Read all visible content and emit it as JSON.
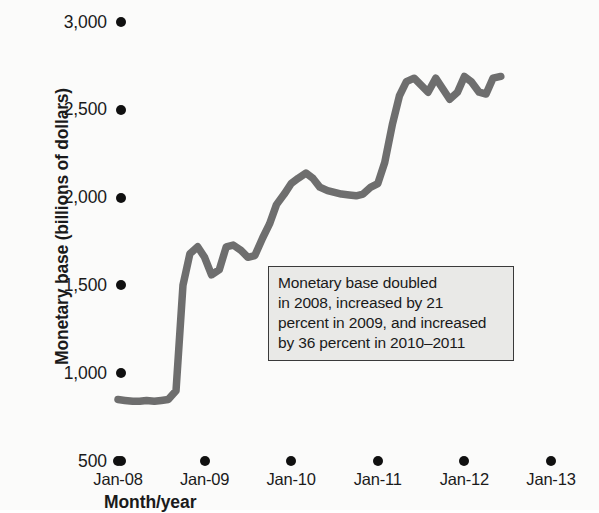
{
  "figure": {
    "background_color": "#fbfbfa",
    "line_color": "#6e6e6e",
    "tick_color": "#101010",
    "annotation_fill": "#e9e9e7",
    "annotation_border": "#3a3a3a"
  },
  "annotation": {
    "name": "monetary-base-callout",
    "lines": [
      "Monetary base doubled",
      "in 2008, increased by 21",
      "percent in 2009, and increased",
      "by 36 percent in 2010–2011"
    ]
  },
  "chart_data": {
    "type": "line",
    "title": "",
    "xlabel": "Month/year",
    "ylabel": "Monetary base (billions of dollars)",
    "ylim": [
      500,
      3000
    ],
    "ytick_values": [
      3000,
      2500,
      2000,
      1500,
      1000,
      500
    ],
    "ytick_labels": [
      "3,000",
      "2,500",
      "2,000",
      "1,500",
      "1,000",
      "500"
    ],
    "xtick_labels": [
      "Jan-08",
      "Jan-09",
      "Jan-10",
      "Jan-11",
      "Jan-12",
      "Jan-13"
    ],
    "xtick_values": [
      2008.0,
      2009.0,
      2010.0,
      2011.0,
      2012.0,
      2013.0
    ],
    "xlim": [
      2008.0,
      2013.0
    ],
    "grid": false,
    "legend": null,
    "series": [
      {
        "name": "Monetary base",
        "units": "billions of dollars",
        "x": [
          2008.0,
          2008.08,
          2008.17,
          2008.25,
          2008.33,
          2008.42,
          2008.5,
          2008.58,
          2008.67,
          2008.75,
          2008.83,
          2008.92,
          2009.0,
          2009.08,
          2009.17,
          2009.25,
          2009.33,
          2009.42,
          2009.5,
          2009.58,
          2009.67,
          2009.75,
          2009.83,
          2009.92,
          2010.0,
          2010.08,
          2010.17,
          2010.25,
          2010.33,
          2010.42,
          2010.5,
          2010.58,
          2010.67,
          2010.75,
          2010.83,
          2010.92,
          2011.0,
          2011.08,
          2011.17,
          2011.25,
          2011.33,
          2011.42,
          2011.5,
          2011.58,
          2011.67,
          2011.75,
          2011.83,
          2011.92,
          2012.0,
          2012.08,
          2012.17,
          2012.25,
          2012.33,
          2012.42
        ],
        "y": [
          850,
          845,
          840,
          840,
          845,
          840,
          845,
          850,
          900,
          1500,
          1680,
          1720,
          1660,
          1560,
          1590,
          1720,
          1730,
          1700,
          1660,
          1670,
          1770,
          1850,
          1960,
          2020,
          2080,
          2110,
          2140,
          2110,
          2060,
          2040,
          2030,
          2020,
          2015,
          2010,
          2020,
          2060,
          2080,
          2200,
          2420,
          2580,
          2660,
          2680,
          2640,
          2600,
          2680,
          2620,
          2560,
          2600,
          2690,
          2660,
          2600,
          2590,
          2680,
          2690
        ]
      }
    ]
  }
}
